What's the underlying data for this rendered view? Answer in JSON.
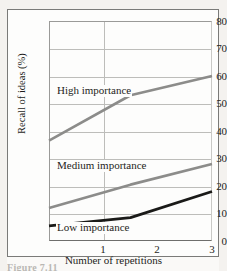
{
  "chart_data": {
    "type": "line",
    "title": "",
    "xlabel": "Number of repetitions",
    "ylabel": "Recall of ideas (%)",
    "x": [
      1,
      2,
      3
    ],
    "xtick_labels": [
      "1",
      "2",
      "3"
    ],
    "ytick_labels": [
      "0",
      "10",
      "20",
      "30",
      "40",
      "50",
      "60",
      "70",
      "80"
    ],
    "yticks": [
      0,
      10,
      20,
      30,
      40,
      50,
      60,
      70,
      80
    ],
    "ylim": [
      0,
      80
    ],
    "xlim": [
      1,
      3
    ],
    "grid": true,
    "legend_position": "inline-annotations",
    "series": [
      {
        "name": "High importance",
        "label": "High importance",
        "values": [
          36.5,
          53,
          60
        ],
        "color": "#8c8c8a",
        "width": 2.6
      },
      {
        "name": "Medium importance",
        "label": "Medium importance",
        "values": [
          12,
          20.5,
          28
        ],
        "color": "#8c8c8a",
        "width": 2.6
      },
      {
        "name": "Low importance",
        "label": "Low importance",
        "values": [
          5.5,
          8.5,
          18
        ],
        "color": "#1a1a18",
        "width": 2.8
      }
    ],
    "annotations": [
      {
        "text": "High importance",
        "x_px": 56,
        "y_px": 91
      },
      {
        "text": "Medium importance",
        "x_px": 56,
        "y_px": 166
      },
      {
        "text": "Low importance",
        "x_px": 56,
        "y_px": 227
      }
    ]
  },
  "caption": {
    "partial_text": "Figure  7.11"
  }
}
